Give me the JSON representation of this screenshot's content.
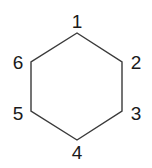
{
  "figure": {
    "shape": "hexagon",
    "background_color": "#ffffff",
    "stroke_color": "#3a3a3a",
    "label_color": "#1a1a1a",
    "stroke_width": 1.4,
    "vertices": [
      {
        "id": "v1",
        "label": "1",
        "x": 77,
        "y": 33,
        "label_x": 77,
        "label_y": 22
      },
      {
        "id": "v2",
        "label": "2",
        "x": 122,
        "y": 62,
        "label_x": 136,
        "label_y": 63
      },
      {
        "id": "v3",
        "label": "3",
        "x": 122,
        "y": 111,
        "label_x": 136,
        "label_y": 114
      },
      {
        "id": "v4",
        "label": "4",
        "x": 77,
        "y": 140,
        "label_x": 77,
        "label_y": 153
      },
      {
        "id": "v5",
        "label": "5",
        "x": 31,
        "y": 111,
        "label_x": 18,
        "label_y": 114
      },
      {
        "id": "v6",
        "label": "6",
        "x": 31,
        "y": 62,
        "label_x": 18,
        "label_y": 63
      }
    ],
    "path": "M 77 33 L 122 62 L 122 111 L 77 140 L 31 111 L 31 62 Z"
  }
}
